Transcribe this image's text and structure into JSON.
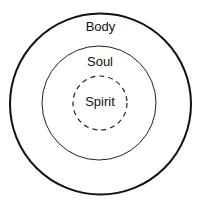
{
  "diagram": {
    "type": "concentric-circles",
    "layers": [
      {
        "label": "Body",
        "style": "solid-thick"
      },
      {
        "label": "Soul",
        "style": "solid-thin"
      },
      {
        "label": "Spirit",
        "style": "dashed"
      }
    ],
    "colors": {
      "stroke": "#111111",
      "background": "#ffffff"
    }
  }
}
